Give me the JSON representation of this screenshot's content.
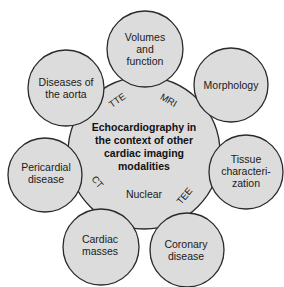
{
  "diagram": {
    "center": {
      "lines": [
        "Echocardiography in",
        "the context of other",
        "cardiac imaging",
        "modalities"
      ]
    },
    "satellites": [
      {
        "id": "volumes",
        "lines": [
          "Volumes",
          "and",
          "function"
        ]
      },
      {
        "id": "morphology",
        "lines": [
          "Morphology"
        ]
      },
      {
        "id": "tissue",
        "lines": [
          "Tissue",
          "characteri-",
          "zation"
        ]
      },
      {
        "id": "coronary",
        "lines": [
          "Coronary",
          "disease"
        ]
      },
      {
        "id": "masses",
        "lines": [
          "Cardiac",
          "masses"
        ]
      },
      {
        "id": "pericardial",
        "lines": [
          "Pericardial",
          "disease"
        ]
      },
      {
        "id": "aorta",
        "lines": [
          "Diseases of",
          "the aorta"
        ]
      }
    ],
    "modalities": [
      "TTE",
      "MRI",
      "TEE",
      "Nuclear",
      "CT"
    ],
    "colors": {
      "fill": "#dcdcdc",
      "stroke": "#2a2a2a",
      "text": "#1a1a1a"
    }
  }
}
